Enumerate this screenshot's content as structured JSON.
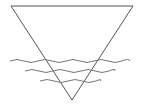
{
  "symbol": {
    "name": "water table symbol",
    "description": "Inverted triangle with three wavy lines",
    "stroke_color": "#555555",
    "background": "#ffffff",
    "triangle": {
      "top_left": [
        11,
        6
      ],
      "top_right": [
        133,
        6
      ],
      "apex": [
        72,
        100
      ]
    },
    "waves": [
      {
        "x_start": 10,
        "x_end": 130,
        "y": 61
      },
      {
        "x_start": 25,
        "x_end": 115,
        "y": 71
      },
      {
        "x_start": 40,
        "x_end": 100,
        "y": 81
      }
    ]
  }
}
